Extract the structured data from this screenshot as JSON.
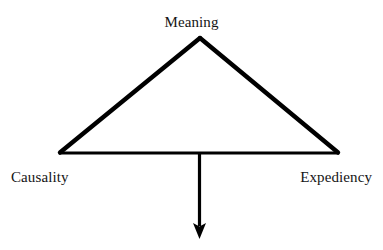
{
  "diagram": {
    "type": "triangle-with-downward-arrow",
    "background_color": "#ffffff",
    "stroke_color": "#000000",
    "labels": {
      "apex": "Meaning",
      "bottom_left": "Causality",
      "bottom_right": "Expediency"
    },
    "geometry": {
      "apex": [
        200,
        37
      ],
      "bottom_left": [
        59,
        153
      ],
      "bottom_right": [
        339,
        153
      ],
      "arrow_start": [
        199,
        153
      ],
      "arrow_tip": [
        199,
        239
      ],
      "side_stroke_width": 4,
      "base_stroke_width": 3,
      "arrow_stroke_width": 3,
      "arrow_head_width": 13,
      "arrow_head_height": 15
    }
  }
}
